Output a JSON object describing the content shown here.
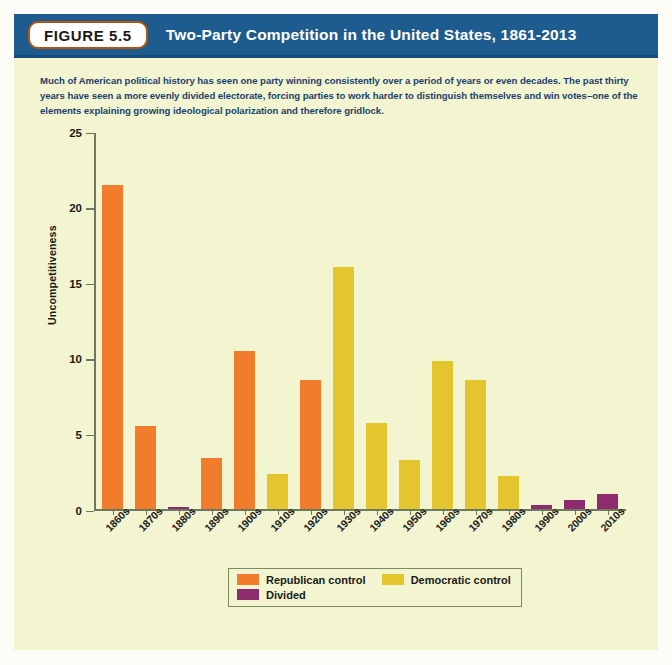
{
  "header": {
    "badge": "FIGURE 5.5",
    "title": "Two-Party Competition in the United States, 1861-2013"
  },
  "caption": "Much of American political history has seen one party winning consistently over a period of years or even decades. The past thirty years have seen a more evenly divided electorate, forcing parties to work harder to distinguish themselves and win votes–one of the elements explaining growing ideological polarization and therefore gridlock.",
  "colors": {
    "republican": "#F07C2C",
    "democratic": "#E5C52E",
    "divided": "#8E2A6E",
    "header_bar": "#1e5b8e",
    "panel_bg": "#f2f5cf",
    "axis": "#6b7a5e",
    "caption_text": "#1e3f6e"
  },
  "legend": {
    "items": [
      {
        "label": "Republican control",
        "color": "#F07C2C",
        "key": "republican"
      },
      {
        "label": "Democratic control",
        "color": "#E5C52E",
        "key": "democratic"
      },
      {
        "label": "Divided",
        "color": "#8E2A6E",
        "key": "divided"
      }
    ]
  },
  "chart_data": {
    "type": "bar",
    "title": "Two-Party Competition in the United States, 1861-2013",
    "xlabel": "",
    "ylabel": "Uncompetitiveness",
    "ylim": [
      0,
      25
    ],
    "yticks": [
      0,
      5,
      10,
      15,
      20,
      25
    ],
    "grid": false,
    "legend_position": "below-axes",
    "categories": [
      "1860s",
      "1870s",
      "1880s",
      "1890s",
      "1900s",
      "1910s",
      "1920s",
      "1930s",
      "1940s",
      "1950s",
      "1960s",
      "1970s",
      "1980s",
      "1990s",
      "2000s",
      "2010s"
    ],
    "values": [
      21.5,
      5.5,
      0.15,
      3.4,
      10.5,
      2.3,
      8.6,
      16.1,
      5.7,
      3.25,
      9.85,
      8.6,
      2.2,
      0.25,
      0.6,
      1.0
    ],
    "bar_categories": [
      "republican",
      "republican",
      "divided",
      "republican",
      "republican",
      "democratic",
      "republican",
      "democratic",
      "democratic",
      "democratic",
      "democratic",
      "democratic",
      "democratic",
      "divided",
      "divided",
      "divided"
    ],
    "series": [
      {
        "name": "Republican control",
        "color": "#F07C2C",
        "points": [
          {
            "x": "1860s",
            "y": 21.5
          },
          {
            "x": "1870s",
            "y": 5.5
          },
          {
            "x": "1890s",
            "y": 3.4
          },
          {
            "x": "1900s",
            "y": 10.5
          },
          {
            "x": "1920s",
            "y": 8.6
          }
        ]
      },
      {
        "name": "Democratic control",
        "color": "#E5C52E",
        "points": [
          {
            "x": "1910s",
            "y": 2.3
          },
          {
            "x": "1930s",
            "y": 16.1
          },
          {
            "x": "1940s",
            "y": 5.7
          },
          {
            "x": "1950s",
            "y": 3.25
          },
          {
            "x": "1960s",
            "y": 9.85
          },
          {
            "x": "1970s",
            "y": 8.6
          },
          {
            "x": "1980s",
            "y": 2.2
          }
        ]
      },
      {
        "name": "Divided",
        "color": "#8E2A6E",
        "points": [
          {
            "x": "1880s",
            "y": 0.15
          },
          {
            "x": "1990s",
            "y": 0.25
          },
          {
            "x": "2000s",
            "y": 0.6
          },
          {
            "x": "2010s",
            "y": 1.0
          }
        ]
      }
    ]
  }
}
